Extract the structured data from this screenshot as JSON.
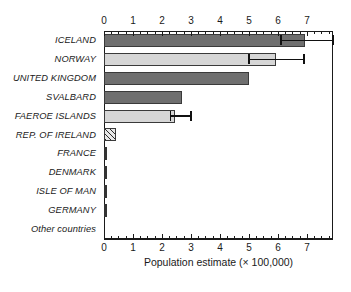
{
  "chart_data": {
    "type": "bar",
    "orientation": "horizontal",
    "title": "",
    "xlabel": "Population estimate (× 100,000)",
    "ylabel": "",
    "xlim": [
      0,
      7.9
    ],
    "ylim": null,
    "grid": false,
    "legend": null,
    "x_ticks": [
      0,
      1,
      2,
      3,
      4,
      5,
      6,
      7
    ],
    "x_tick_labels": [
      "0",
      "1",
      "2",
      "3",
      "4",
      "5",
      "6",
      "7"
    ],
    "minor_tick_step": 0.25,
    "axis_positions": [
      "top",
      "bottom"
    ],
    "categories": [
      "ICELAND",
      "NORWAY",
      "UNITED KINGDOM",
      "SVALBARD",
      "FAEROE ISLANDS",
      "REP. OF IRELAND",
      "FRANCE",
      "DENMARK",
      "ISLE OF MAN",
      "GERMANY",
      "Other countries"
    ],
    "values": [
      6.95,
      5.95,
      5.0,
      2.7,
      2.45,
      0.4,
      0.05,
      0.03,
      0.04,
      0.05,
      0.0
    ],
    "fills": [
      "dark",
      "light",
      "dark",
      "dark",
      "light",
      "hatch",
      "tiny",
      "tiny",
      "tiny",
      "tiny",
      "none"
    ],
    "error_bars": [
      {
        "category": "ICELAND",
        "low": 6.1,
        "high": 7.9
      },
      {
        "category": "NORWAY",
        "low": 5.0,
        "high": 6.9
      },
      {
        "category": "FAEROE ISLANDS",
        "low": 2.3,
        "high": 3.0
      }
    ],
    "colors": {
      "dark_bar": "#6f6f6f",
      "light_bar": "#d6d6d6",
      "hatch_bar": "#e8e8e8",
      "tiny_bar": "#333333",
      "axis": "#1a1a1a",
      "error_bar": "#111111",
      "background": "#ffffff"
    }
  },
  "axis": {
    "x_title": "Population estimate (× 100,000)"
  }
}
